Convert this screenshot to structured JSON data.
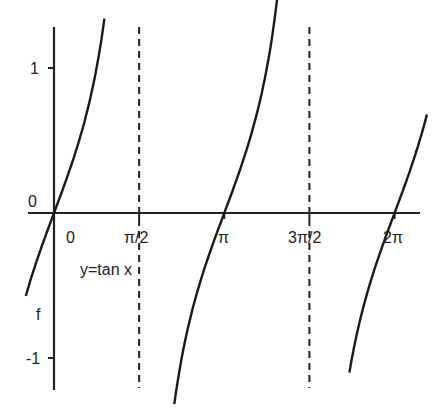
{
  "chart_data": {
    "type": "line",
    "title": "",
    "function_label": "y=tan x",
    "ylabel": "f",
    "xlabel": "",
    "x_ticks": [
      {
        "label": "0",
        "value": 0
      },
      {
        "label": "π/2",
        "value": 1.5708
      },
      {
        "label": "π",
        "value": 3.1416
      },
      {
        "label": "3π/2",
        "value": 4.7124
      },
      {
        "label": "2π",
        "value": 6.2832
      }
    ],
    "y_ticks": [
      {
        "label": "1",
        "value": 1
      },
      {
        "label": "0",
        "value": 0
      },
      {
        "label": "-1",
        "value": -1
      }
    ],
    "asymptotes": [
      1.5708,
      4.7124
    ],
    "xlim": [
      -0.5,
      6.9
    ],
    "ylim": [
      -1.2,
      1.0
    ],
    "series": [
      {
        "name": "tan x",
        "branches": [
          [
            -0.52,
            0.93
          ],
          [
            2.22,
            4.12
          ],
          [
            5.45,
            6.88
          ]
        ]
      }
    ],
    "grid": false,
    "legend": "none"
  }
}
